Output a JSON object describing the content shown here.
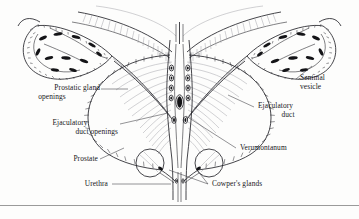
{
  "figure": {
    "background_color": "#fdfdfc",
    "ink_color": "#1a1a1d",
    "line_color": "#2b2b30",
    "hairline_color": "#8c8c93",
    "lumen_fill": "#111114"
  },
  "labels": {
    "prostatic_gland_openings": {
      "line1": "Prostatic gland",
      "line2": "openings"
    },
    "ejaculatory_duct_openings": {
      "line1": "Ejaculatory",
      "line2": "duct openings"
    },
    "prostate": "Prostate",
    "urethra": "Urethra",
    "seminal_vesicle": {
      "line1": "Seminal",
      "line2": "vesicle"
    },
    "ejaculatory_duct": {
      "line1": "Ejaculatory",
      "line2": "duct"
    },
    "verumontanum": "Verumontanum",
    "cowpers_glands": "Cowper's glands"
  },
  "structures": [
    {
      "name": "bladder-wall",
      "side": "both"
    },
    {
      "name": "seminal-vesicle-left",
      "side": "left"
    },
    {
      "name": "seminal-vesicle-right",
      "side": "right"
    },
    {
      "name": "prostate-capsule",
      "side": "both"
    },
    {
      "name": "prostatic-urethra",
      "side": "center"
    },
    {
      "name": "verumontanum",
      "side": "center"
    },
    {
      "name": "ejaculatory-duct-left",
      "side": "left"
    },
    {
      "name": "ejaculatory-duct-right",
      "side": "right"
    },
    {
      "name": "cowpers-gland-left",
      "side": "left"
    },
    {
      "name": "cowpers-gland-right",
      "side": "right"
    },
    {
      "name": "prostatic-gland-opening",
      "side": "center"
    }
  ]
}
